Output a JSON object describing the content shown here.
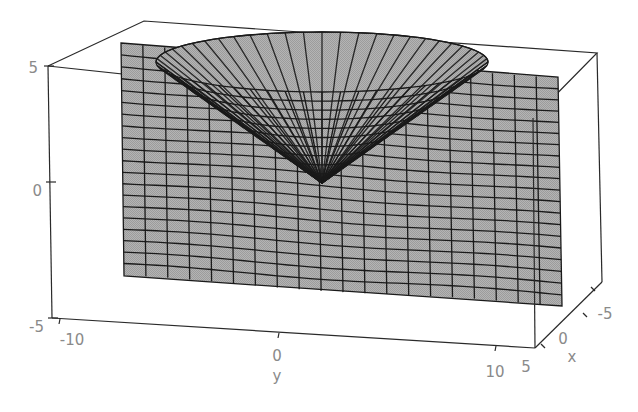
{
  "chart_data": {
    "type": "surface3d",
    "title": "",
    "axes": {
      "x": {
        "label": "x",
        "ticks": [
          5,
          0,
          -5
        ],
        "range": [
          5,
          -5
        ]
      },
      "y": {
        "label": "y",
        "ticks": [
          -10,
          0,
          10
        ],
        "range": [
          -10,
          10
        ]
      },
      "z": {
        "label": "",
        "ticks": [
          -5,
          0,
          5
        ],
        "range": [
          -5,
          5
        ]
      }
    },
    "surfaces": [
      {
        "name": "vertical-plane",
        "mesh_rows": 20,
        "mesh_cols": 20,
        "fill": "#a9a9a9",
        "edge": "#1a1a1a"
      },
      {
        "name": "cone-surface",
        "vertex": {
          "y": 1,
          "z": 1.5
        },
        "fill": "#a9a9a9",
        "edge": "#1a1a1a"
      }
    ],
    "box": true,
    "grid": false
  },
  "labels": {
    "z_ticks": [
      "5",
      "0",
      "-5"
    ],
    "y_ticks": [
      "-10",
      "0",
      "10"
    ],
    "x_ticks": [
      "5",
      "0",
      "-5"
    ],
    "y_axis": "y",
    "x_axis": "x"
  },
  "colors": {
    "surface": "#a9a9a9",
    "mesh": "#1a1a1a",
    "box": "#2a2a2a",
    "text": "#8a8a8a",
    "background": "#ffffff"
  }
}
